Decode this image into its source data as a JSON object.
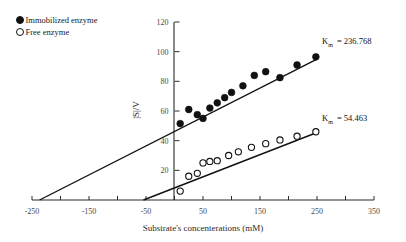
{
  "legend": {
    "position": "top-left",
    "items": [
      {
        "label": "Immobilized enzyme",
        "marker": "filled-circle"
      },
      {
        "label": "Free enzyme",
        "marker": "open-circle"
      }
    ]
  },
  "annotations": [
    {
      "name": "km-immobilized",
      "symbol": "K",
      "subscript": "m",
      "text": "= 236.768",
      "value": 236.768
    },
    {
      "name": "km-free",
      "symbol": "K",
      "subscript": "m",
      "text": "= 54.463",
      "value": 54.463
    }
  ],
  "axes": {
    "x": {
      "title": "Substrate's concenterations (mM)",
      "min": -250,
      "max": 350,
      "tick_step": 50,
      "labels": [
        "-250",
        "-150",
        "-50",
        "50",
        "150",
        "250",
        "350"
      ],
      "label_values": [
        -250,
        -150,
        -50,
        50,
        150,
        250,
        350
      ]
    },
    "y": {
      "title": "|S|/V",
      "min": 0,
      "max": 120,
      "tick_step": 20,
      "labels": [
        "20",
        "40",
        "60",
        "80",
        "100",
        "120"
      ],
      "label_values": [
        20,
        40,
        60,
        80,
        100,
        120
      ]
    }
  },
  "chart_data": {
    "type": "scatter",
    "title": "",
    "xlabel": "Substrate's concenterations (mM)",
    "ylabel": "|S|/V",
    "xlim": [
      -250,
      350
    ],
    "ylim": [
      0,
      120
    ],
    "grid": false,
    "legend_position": "top-left",
    "series": [
      {
        "name": "Immobilized enzyme",
        "marker": "filled-circle",
        "x": [
          10,
          25,
          40,
          50,
          62,
          75,
          88,
          100,
          120,
          140,
          160,
          185,
          215,
          248
        ],
        "y": [
          51.5,
          61.0,
          57.5,
          55.0,
          62.0,
          65.5,
          69.0,
          72.5,
          77.0,
          84.0,
          86.5,
          82.5,
          91.0,
          96.5
        ],
        "fit_line": {
          "x_intercept": -236.768,
          "x_start": -236.768,
          "x_end": 250,
          "y_start": 0,
          "y_end": 95.0
        }
      },
      {
        "name": "Free enzyme",
        "marker": "open-circle",
        "x": [
          10,
          25,
          40,
          50,
          62,
          75,
          95,
          112,
          135,
          160,
          185,
          215,
          248
        ],
        "y": [
          6.0,
          16.0,
          18.0,
          25.0,
          26.0,
          26.5,
          30.0,
          32.5,
          35.5,
          38.0,
          40.5,
          43.0,
          46.0
        ],
        "fit_line": {
          "x_intercept": -54.463,
          "x_start": -54.463,
          "x_end": 250,
          "y_start": 0,
          "y_end": 45.5
        }
      }
    ]
  }
}
